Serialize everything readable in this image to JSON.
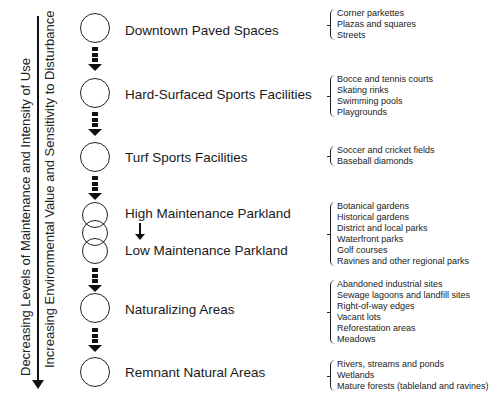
{
  "axis": {
    "primary_label": "Decreasing Levels of Maintenance and Intensity of Use",
    "secondary_label": "Increasing Environmental Value and Sensitivity to Disturbance",
    "direction": "downward"
  },
  "stages": [
    {
      "label": "Downtown Paved Spaces",
      "examples": [
        "Corner parkettes",
        "Plazas and squares",
        "Streets"
      ]
    },
    {
      "label": "Hard-Surfaced Sports Facilities",
      "examples": [
        "Bocce and tennis courts",
        "Skating rinks",
        "Swimming pools",
        "Playgrounds"
      ]
    },
    {
      "label": "Turf Sports Facilities",
      "examples": [
        "Soccer and cricket fields",
        "Baseball diamonds"
      ]
    },
    {
      "label": "High Maintenance Parkland",
      "label_secondary": "Low Maintenance Parkland",
      "examples": [
        "Botanical gardens",
        "Historical gardens",
        "District and local parks",
        "Waterfront parks",
        "Golf courses",
        "Ravines and other regional parks"
      ]
    },
    {
      "label": "Naturalizing Areas",
      "examples": [
        "Abandoned industrial sites",
        "Sewage lagoons and landfill sites",
        "Right-of-way edges",
        "Vacant lots",
        "Reforestation areas",
        "Meadows"
      ]
    },
    {
      "label": "Remnant Natural Areas",
      "examples": [
        "Rivers, streams and ponds",
        "Wetlands",
        "Mature forests (tableland and ravines)"
      ]
    }
  ],
  "colors": {
    "line": "#111111",
    "text": "#1a1a1a",
    "background": "#ffffff"
  }
}
